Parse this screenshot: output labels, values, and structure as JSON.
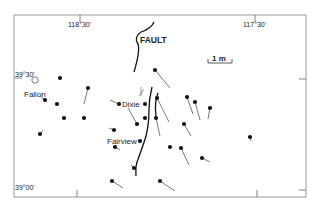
{
  "map": {
    "title": "FAULT",
    "scale_label": "1 m",
    "longitude_labels": [
      {
        "text": "118°30'",
        "x": 80
      },
      {
        "text": "117°30'",
        "x": 255
      }
    ],
    "latitude_labels": [
      {
        "text": "39°30'",
        "y": 76
      },
      {
        "text": "39°00'",
        "y": 188
      }
    ],
    "places": [
      {
        "name": "Fallon",
        "type": "circle",
        "x": 35,
        "y": 80,
        "label_x": 24,
        "label_y": 94
      },
      {
        "name": "Dixie",
        "type": "dot",
        "x": 140,
        "y": 104,
        "label_x": 122,
        "label_y": 104
      },
      {
        "name": "Fairview",
        "type": "dot",
        "x": 141,
        "y": 140,
        "label_x": 108,
        "label_y": 141
      }
    ],
    "stations": [
      {
        "x": 60,
        "y": 78,
        "tx": 60,
        "ty": 78
      },
      {
        "x": 88,
        "y": 88,
        "tx": 84,
        "ty": 104
      },
      {
        "x": 45,
        "y": 100,
        "tx": 41,
        "ty": 97
      },
      {
        "x": 57,
        "y": 104,
        "tx": 57,
        "ty": 104
      },
      {
        "x": 64,
        "y": 118,
        "tx": 64,
        "ty": 118
      },
      {
        "x": 40,
        "y": 134,
        "tx": 43,
        "ty": 130
      },
      {
        "x": 84,
        "y": 118,
        "tx": 84,
        "ty": 118
      },
      {
        "x": 114,
        "y": 130,
        "tx": 109,
        "ty": 128
      },
      {
        "x": 119,
        "y": 104,
        "tx": 110,
        "ty": 100
      },
      {
        "x": 155,
        "y": 70,
        "tx": 170,
        "ty": 88
      },
      {
        "x": 145,
        "y": 118,
        "tx": 145,
        "ty": 118
      },
      {
        "x": 137,
        "y": 124,
        "tx": 128,
        "ty": 108
      },
      {
        "x": 157,
        "y": 98,
        "tx": 169,
        "ty": 122
      },
      {
        "x": 156,
        "y": 118,
        "tx": 160,
        "ty": 136
      },
      {
        "x": 187,
        "y": 97,
        "tx": 193,
        "ty": 114
      },
      {
        "x": 195,
        "y": 102,
        "tx": 200,
        "ty": 120
      },
      {
        "x": 210,
        "y": 108,
        "tx": 208,
        "ty": 119
      },
      {
        "x": 184,
        "y": 124,
        "tx": 191,
        "ty": 136
      },
      {
        "x": 115,
        "y": 147,
        "tx": 120,
        "ty": 150
      },
      {
        "x": 170,
        "y": 147,
        "tx": 170,
        "ty": 147
      },
      {
        "x": 181,
        "y": 148,
        "tx": 189,
        "ty": 165
      },
      {
        "x": 202,
        "y": 158,
        "tx": 210,
        "ty": 162
      },
      {
        "x": 250,
        "y": 137,
        "tx": 251,
        "ty": 141
      },
      {
        "x": 134,
        "y": 168,
        "tx": 131,
        "ty": 165
      },
      {
        "x": 112,
        "y": 181,
        "tx": 123,
        "ty": 188
      },
      {
        "x": 160,
        "y": 181,
        "tx": 175,
        "ty": 191
      }
    ],
    "colors": {
      "frame": "#9a9a9a",
      "ink": "#111111",
      "tail": "#555555"
    }
  }
}
